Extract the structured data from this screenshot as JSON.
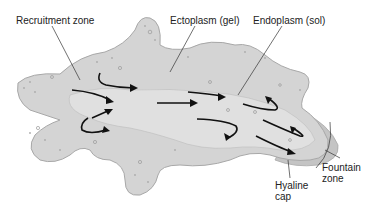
{
  "diagram": {
    "labels": {
      "recruitment_zone": "Recruitment zone",
      "ectoplasm": "Ectoplasm (gel)",
      "endoplasm": "Endoplasm (sol)",
      "hyaline_cap_line1": "Hyaline",
      "hyaline_cap_line2": "cap",
      "fountain_zone_line1": "Fountain",
      "fountain_zone_line2": "zone"
    },
    "colors": {
      "cell_fill": "#d4d4d4",
      "cell_outline": "#a8a8a8",
      "endoplasm_fill": "#e2e2e2",
      "hyaline_fill": "#c4c4c4",
      "arrow": "#111111",
      "leader_line": "#333333"
    }
  }
}
